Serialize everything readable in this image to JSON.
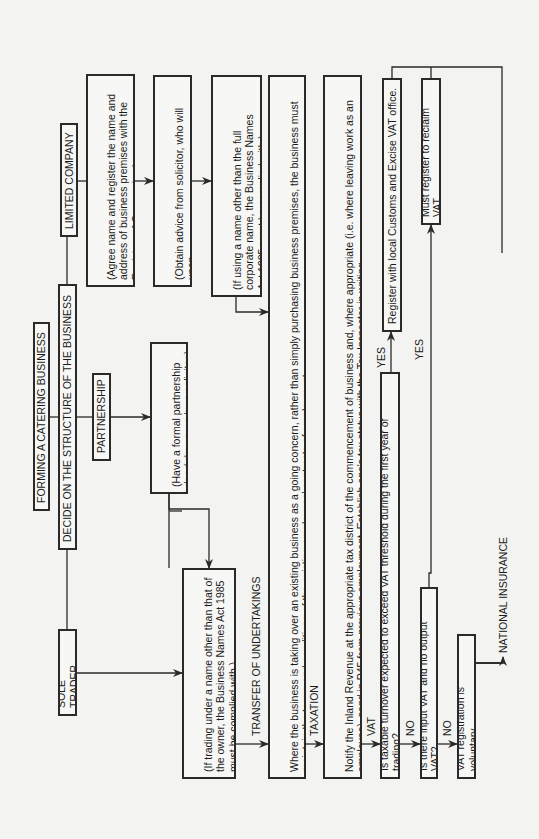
{
  "title": "FORMING A CATERING BUSINESS",
  "decide": "DECIDE ON THE STRUCTURE OF THE BUSINESS",
  "structures": {
    "sole_trader": "SOLE TRADER",
    "partnership": "PARTNERSHIP",
    "limited_company": "LIMITED COMPANY"
  },
  "notes": {
    "sole_trader_name": "(If trading under a name other than that of\nthe owner, the Business Names Act 1985\nmust be complied with.)",
    "partnership_deed": "(Have a formal partnership\ndeed drawn up by a solicitor.)",
    "ltd_register": "(Agree name and register the name and\naddress of business premises with the\nRegistrar of Companies.)",
    "ltd_solicitor": "(Obtain advice from solicitor, who will upon\ninstruction incorporate the company.)",
    "ltd_name": "(If using a name other than the full\ncorporate name, the Business Names\nAct 1985 must be complied with.)"
  },
  "sections": {
    "transfer_label": "TRANSFER OF UNDERTAKINGS",
    "transfer_text": "Where the business is taking over an existing business as a going concern, rather than simply purchasing business premises, the business must\nmaintain the terms and conditions of the existing employees' contracts of employment.",
    "taxation_label": "TAXATION",
    "taxation_text": "Notify the Inland Revenue at the appropriate tax district of the commencement of business and, where appropriate (i.e. where leaving work as an\nemployee), send in P45 from previous employment. Establish one's tax status with the Tax Inspector in writing.",
    "vat_label": "VAT",
    "vat_question": "Is taxable turnover expected to exceed VAT threshold during the first year of trading?",
    "yes_1": "YES",
    "register_vat": "Register with local Customs and Excise VAT office.",
    "no_1": "NO",
    "input_vat_question": "Is there input VAT and no output VAT?",
    "yes_2": "YES",
    "must_register": "Must register to reclaim VAT.",
    "no_2": "NO",
    "voluntary": "VAT registration is voluntary",
    "national_insurance": "NATIONAL INSURANCE"
  },
  "colors": {
    "line": "#2a2a2a",
    "paper": "#f3f3f1"
  }
}
